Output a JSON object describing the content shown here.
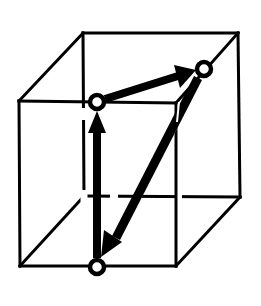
{
  "diagram": {
    "type": "cube-vector-loop",
    "colors": {
      "line": "#000000",
      "background": "#ffffff",
      "node_fill": "#ffffff"
    },
    "cube": {
      "front_face": {
        "top_left": [
          19,
          101
        ],
        "top_right": [
          176,
          103
        ],
        "bottom_right": [
          176,
          266
        ],
        "bottom_left": [
          20,
          266
        ]
      },
      "back_face": {
        "top_left": [
          83,
          33
        ],
        "top_right": [
          238,
          33
        ],
        "bottom_right": [
          240,
          197
        ],
        "bottom_left": [
          84,
          196
        ]
      }
    },
    "nodes": [
      {
        "id": "front-top-middle",
        "x": 97,
        "y": 102
      },
      {
        "id": "back-top-right-diagonal",
        "x": 204,
        "y": 69
      },
      {
        "id": "front-bottom-middle",
        "x": 97,
        "y": 267
      }
    ],
    "arrows": [
      {
        "from": "front-bottom-middle",
        "to": "front-top-middle",
        "label": "vertical-up"
      },
      {
        "from": "front-top-middle",
        "to": "back-top-right-diagonal",
        "label": "top-face-diagonal"
      },
      {
        "from": "back-top-right-diagonal",
        "to": "front-bottom-middle",
        "label": "space-diagonal-down"
      }
    ]
  }
}
